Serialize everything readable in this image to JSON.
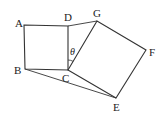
{
  "diagram": {
    "points": {
      "A": {
        "x": 24,
        "y": 25,
        "label": "A"
      },
      "B": {
        "x": 25,
        "y": 69,
        "label": "B"
      },
      "C": {
        "x": 68,
        "y": 70,
        "label": "C"
      },
      "D": {
        "x": 68,
        "y": 26,
        "label": "D"
      },
      "E": {
        "x": 116,
        "y": 98,
        "label": "E"
      },
      "F": {
        "x": 146,
        "y": 50,
        "label": "F"
      },
      "G": {
        "x": 97,
        "y": 21,
        "label": "G"
      }
    },
    "angle_label": "θ",
    "colors": {
      "stroke": "#333333",
      "background": "#ffffff"
    }
  }
}
